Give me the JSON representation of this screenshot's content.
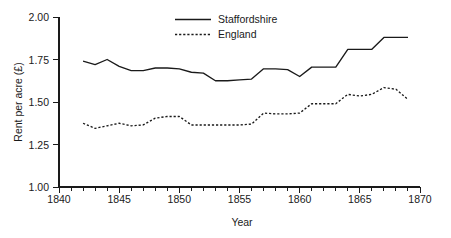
{
  "chart_data": {
    "type": "line",
    "title": "",
    "xlabel": "Year",
    "ylabel": "Rent per acre (£)",
    "xlim": [
      1840,
      1870
    ],
    "ylim": [
      1.0,
      2.0
    ],
    "grid": false,
    "legend_position": "top-center",
    "x_ticks_major": [
      1840,
      1845,
      1850,
      1855,
      1860,
      1865,
      1870
    ],
    "x_tick_labels": [
      "1840",
      "1845",
      "1850",
      "1855",
      "1860",
      "1865",
      "1870"
    ],
    "x_ticks_minor_step": 1,
    "y_ticks": [
      1.0,
      1.25,
      1.5,
      1.75,
      2.0
    ],
    "y_tick_labels": [
      "1.00",
      "1.25",
      "1.50",
      "1.75",
      "2.00"
    ],
    "x": [
      1842,
      1843,
      1844,
      1845,
      1846,
      1847,
      1848,
      1849,
      1850,
      1851,
      1852,
      1853,
      1854,
      1855,
      1856,
      1857,
      1858,
      1859,
      1860,
      1861,
      1862,
      1863,
      1864,
      1865,
      1866,
      1867,
      1868,
      1869
    ],
    "series": [
      {
        "name": "Staffordshire",
        "style": "solid",
        "values": [
          1.74,
          1.72,
          1.75,
          1.71,
          1.685,
          1.685,
          1.7,
          1.7,
          1.695,
          1.675,
          1.67,
          1.625,
          1.625,
          1.63,
          1.635,
          1.695,
          1.695,
          1.69,
          1.65,
          1.705,
          1.705,
          1.705,
          1.81,
          1.81,
          1.81,
          1.88,
          1.88,
          1.88
        ]
      },
      {
        "name": "England",
        "style": "dashed",
        "values": [
          1.375,
          1.345,
          1.36,
          1.375,
          1.36,
          1.365,
          1.405,
          1.415,
          1.415,
          1.365,
          1.365,
          1.365,
          1.365,
          1.365,
          1.37,
          1.435,
          1.43,
          1.43,
          1.435,
          1.49,
          1.49,
          1.49,
          1.545,
          1.535,
          1.545,
          1.585,
          1.575,
          1.515
        ]
      }
    ],
    "legend": [
      {
        "label": "Staffordshire",
        "style": "solid"
      },
      {
        "label": "England",
        "style": "dashed"
      }
    ]
  },
  "layout": {
    "plot_left": 59,
    "plot_right": 420,
    "plot_top": 17,
    "plot_bottom": 187
  }
}
